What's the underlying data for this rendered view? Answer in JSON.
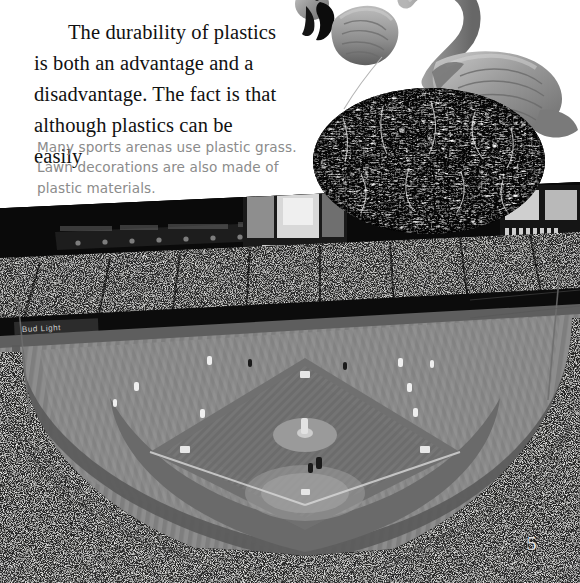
{
  "page": {
    "page_number": "5",
    "background_color": "#ffffff"
  },
  "body_text": {
    "paragraph": "The durability of plastics is both an advantage and a disadvantage. The fact is that although plastics can be easily",
    "color": "#111111"
  },
  "caption": {
    "text": "Many sports arenas use plastic grass. Lawn decorations are also made of plastic materials.",
    "color": "#8b8b8b"
  },
  "figures": {
    "flamingos": {
      "name": "plastic-lawn-flamingos",
      "description": "Two grayscale plastic pink-flamingo lawn ornaments with black beaks",
      "count": "2",
      "color": "#9a9a9a"
    },
    "grass_oval": {
      "name": "plastic-grass-swatch",
      "description": "Oval close-up swatch of artificial plastic grass turf, high-contrast black and white",
      "color": "#0a0a0a"
    },
    "stadium": {
      "name": "baseball-stadium-photo",
      "description": "Night photograph of a baseball stadium interior with artificial grass field, full crowd, scoreboard and video screens",
      "wall_ad_text": "Bud Light",
      "field_color": "#8a8a8a",
      "infield_color": "#6f6f6f",
      "crowd_color": "#141414",
      "sky_color": "#050505"
    }
  }
}
